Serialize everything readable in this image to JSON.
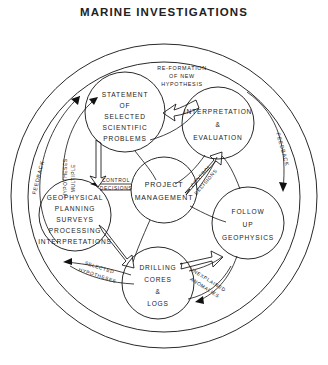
{
  "title": "MARINE INVESTIGATIONS",
  "diagram": {
    "type": "cycle-flow-diagram",
    "nodes": [
      {
        "id": "statement",
        "lines": [
          "STATEMENT",
          "OF",
          "SELECTED",
          "SCIENTIFIC",
          "PROBLEMS"
        ],
        "cx": 125,
        "cy": 112,
        "r": 40
      },
      {
        "id": "interpretation",
        "lines": [
          "INTERPRETATION",
          "&",
          "EVALUATION"
        ],
        "cx": 218,
        "cy": 123,
        "r": 36
      },
      {
        "id": "project",
        "lines": [
          "PROJECT",
          "MANAGEMENT"
        ],
        "cx": 164,
        "cy": 190,
        "r": 33
      },
      {
        "id": "geophysical",
        "lines": [
          "GEOPHYSICAL",
          "PLANNING",
          "SURVEYS",
          "PROCESSING",
          "INTERPRETATIONS"
        ],
        "cx": 75,
        "cy": 215,
        "r": 36
      },
      {
        "id": "followup",
        "lines": [
          "FOLLOW",
          "UP",
          "GEOPHYSICS"
        ],
        "cx": 248,
        "cy": 223,
        "r": 36
      },
      {
        "id": "drilling",
        "lines": [
          "DRILLING",
          "CORES",
          "&",
          "LOGS"
        ],
        "cx": 158,
        "cy": 283,
        "r": 36
      }
    ],
    "edge_labels": [
      {
        "id": "reformation",
        "lines": [
          "RE-FORMATION",
          "OF  NEW",
          "HYPOTHESIS"
        ]
      },
      {
        "id": "feedback-left",
        "text": "FEEDBACK"
      },
      {
        "id": "feedback-right",
        "text": "FEEDBACK"
      },
      {
        "id": "multiple-hypotheses",
        "lines": [
          "MULTIPLE",
          "HYPOTHESES"
        ]
      },
      {
        "id": "control-decisions-left",
        "lines": [
          "CONTROL",
          "DECISIONS"
        ]
      },
      {
        "id": "control-decisions-right",
        "lines": [
          "CONTROL",
          "DECISIONS"
        ]
      },
      {
        "id": "selected-hypotheses",
        "lines": [
          "SELECTED",
          "HYPOTHESES"
        ]
      },
      {
        "id": "unexplained-anomalies",
        "lines": [
          "UNEXPLAINED",
          "ANOMALIES"
        ]
      }
    ]
  }
}
